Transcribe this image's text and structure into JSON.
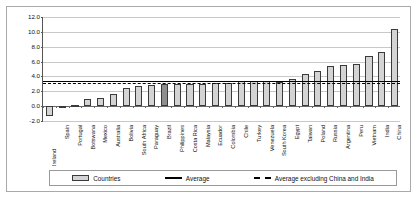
{
  "chart_data": {
    "type": "bar",
    "title": "",
    "xlabel": "",
    "ylabel": "",
    "ylim": [
      -2.0,
      12.0
    ],
    "ytick_step": 2.0,
    "ytick_labels": [
      "12.0",
      "10.0",
      "8.0",
      "6.0",
      "4.0",
      "2.0",
      "0.0",
      "-2.0"
    ],
    "grid": true,
    "legend_position": "bottom",
    "categories": [
      "Ireland",
      "Spain",
      "Portugal",
      "Botswana",
      "Mexico",
      "Australia",
      "Bolivia",
      "South Africa",
      "Paraguay",
      "Brazil",
      "Philippines",
      "Costa Rica",
      "Malaysia",
      "Ecuador",
      "Colombia",
      "Chile",
      "Turkey",
      "Venezuela",
      "South Korea",
      "Egypt",
      "Taiwan",
      "Poland",
      "Russia",
      "Argentina",
      "Peru",
      "Vietnam",
      "India",
      "China"
    ],
    "values": [
      -1.3,
      0.05,
      0.1,
      0.9,
      1.1,
      1.6,
      2.4,
      2.65,
      2.9,
      3.0,
      3.0,
      3.0,
      3.0,
      3.1,
      3.15,
      3.4,
      3.4,
      3.4,
      3.2,
      3.6,
      4.3,
      4.7,
      5.45,
      5.6,
      5.7,
      6.7,
      7.25,
      10.4
    ],
    "highlight_category": "Brazil",
    "series": [
      {
        "name": "Countries",
        "values": [
          -1.3,
          0.05,
          0.1,
          0.9,
          1.1,
          1.6,
          2.4,
          2.65,
          2.9,
          3.0,
          3.0,
          3.0,
          3.0,
          3.1,
          3.15,
          3.4,
          3.4,
          3.4,
          3.2,
          3.6,
          4.3,
          4.7,
          5.45,
          5.6,
          5.7,
          6.7,
          7.25,
          10.4
        ]
      }
    ],
    "reference_lines": [
      {
        "name": "Average",
        "value": 3.45,
        "style": "solid"
      },
      {
        "name": "Average excluding China and India",
        "value": 3.05,
        "style": "dashed"
      }
    ]
  },
  "legend": {
    "items": [
      {
        "label": "Countries",
        "swatch": "bar-swatch"
      },
      {
        "label": "Average",
        "swatch": "solid-line-swatch"
      },
      {
        "label": "Average excluding China and India",
        "swatch": "dashed-line-swatch"
      }
    ]
  },
  "colors": {
    "bar_fill": "#d4d4d4",
    "bar_highlight": "#8e8e8e",
    "bar_border": "#3a3a3a",
    "gridline": "#c8c8c8",
    "axis": "#555555",
    "reference_line": "#000000"
  }
}
